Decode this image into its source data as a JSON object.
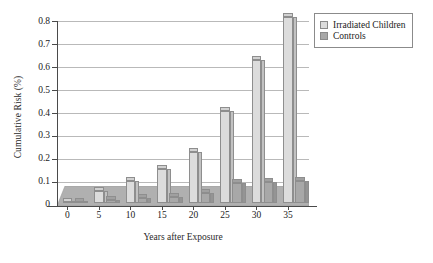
{
  "chart_data": {
    "type": "bar",
    "title": "",
    "xlabel": "Years after Exposure",
    "ylabel": "Cumulative Risk (%)",
    "categories": [
      "0",
      "5",
      "10",
      "15",
      "20",
      "25",
      "30",
      "35"
    ],
    "series": [
      {
        "name": "Irradiated Children",
        "color": "#dcdcdc",
        "values": [
          0.005,
          0.05,
          0.095,
          0.145,
          0.218,
          0.395,
          0.615,
          0.8
        ]
      },
      {
        "name": "Controls",
        "color": "#a8a8a8",
        "values": [
          0.003,
          0.012,
          0.02,
          0.025,
          0.045,
          0.085,
          0.09,
          0.095
        ]
      }
    ],
    "ylim": [
      0,
      0.8
    ],
    "yticks": [
      "0",
      "0.1",
      "0.2",
      "0.3",
      "0.4",
      "0.5",
      "0.6",
      "0.7",
      "0.8"
    ],
    "ytick_values": [
      0,
      0.1,
      0.2,
      0.3,
      0.4,
      0.5,
      0.6,
      0.7,
      0.8
    ],
    "grid": true,
    "legend_position": "top-right",
    "style": "3d-bars"
  },
  "legend": {
    "items": [
      {
        "label": "Irradiated Children",
        "color": "#dcdcdc"
      },
      {
        "label": "Controls",
        "color": "#a8a8a8"
      }
    ]
  },
  "colors": {
    "irradiated": "#dcdcdc",
    "controls": "#a8a8a8",
    "floor": "#b0b0b0",
    "grid": "#b9b9b9",
    "axis": "#4a4a4a"
  }
}
